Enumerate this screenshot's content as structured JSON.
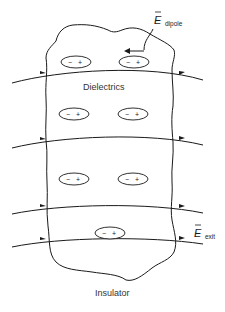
{
  "diagram": {
    "labels": {
      "material": "Dielectrics",
      "body": "Insulator",
      "e_dipole_symbol": "E",
      "e_dipole_subscript": "dipole",
      "e_exit_symbol": "E",
      "e_exit_subscript": "exit"
    },
    "dipoles": [
      {
        "id": "dipole-1",
        "minus": "−",
        "plus": "+",
        "cx": 76,
        "cy": 62
      },
      {
        "id": "dipole-2",
        "minus": "−",
        "plus": "+",
        "cx": 134,
        "cy": 62
      },
      {
        "id": "dipole-3",
        "minus": "−",
        "plus": "+",
        "cx": 74,
        "cy": 114
      },
      {
        "id": "dipole-4",
        "minus": "−",
        "plus": "+",
        "cx": 133,
        "cy": 114
      },
      {
        "id": "dipole-5",
        "minus": "−",
        "plus": "+",
        "cx": 74,
        "cy": 179
      },
      {
        "id": "dipole-6",
        "minus": "−",
        "plus": "+",
        "cx": 133,
        "cy": 179
      },
      {
        "id": "dipole-7",
        "minus": "−",
        "plus": "+",
        "cx": 110,
        "cy": 233
      }
    ],
    "field_lines": 4,
    "field_direction": "left-to-right",
    "dipole_field_direction": "right-to-left",
    "colors": {
      "line": "#1a1a1a",
      "text": "#333333",
      "background": "#ffffff"
    }
  }
}
